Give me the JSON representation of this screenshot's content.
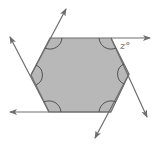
{
  "diagram": {
    "type": "polygon-exterior-angles",
    "shape": "regular hexagon",
    "fill_color": "#b8b8b8",
    "stroke_color": "#6e6e6e",
    "arc_color": "#505050",
    "vertices": [
      [
        50,
        38
      ],
      [
        111,
        38
      ],
      [
        129,
        74
      ],
      [
        111,
        112
      ],
      [
        49,
        112
      ],
      [
        31,
        75
      ]
    ],
    "angle_label": "z°",
    "interior_angle_marks": 6,
    "extended_rays": 6
  }
}
